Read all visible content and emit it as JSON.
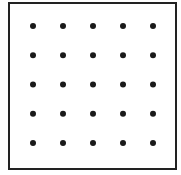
{
  "diagram": {
    "type": "dot-grid",
    "rows": 5,
    "columns": 5,
    "dot_color": "#1a1a1a",
    "border_color": "#222222",
    "background": "#ffffff"
  }
}
